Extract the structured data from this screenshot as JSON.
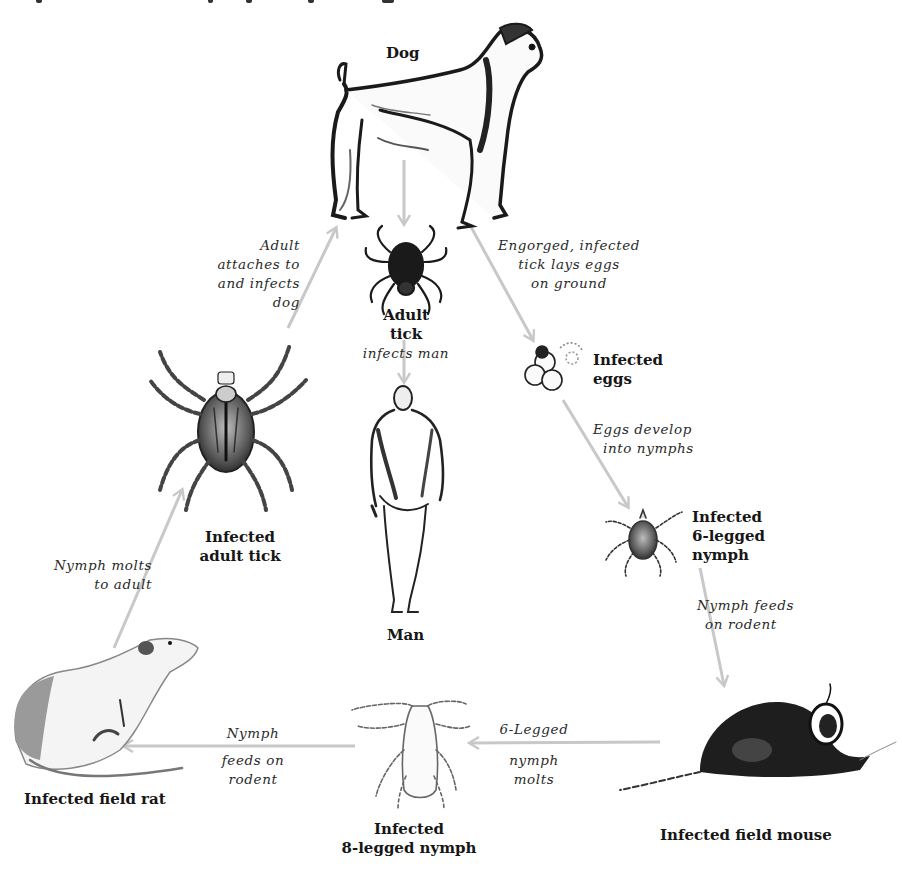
{
  "diagram": {
    "type": "life-cycle",
    "arrow_color": "#c8c8c8",
    "nodes": {
      "dog": {
        "label": "Dog"
      },
      "adult_tick": {
        "label_line1": "Adult",
        "label_line2": "tick",
        "caption": "infects man"
      },
      "man": {
        "label": "Man"
      },
      "infected_eggs": {
        "label_line1": "Infected",
        "label_line2": "eggs"
      },
      "six_legged_nymph": {
        "label_line1": "Infected",
        "label_line2": "6-legged",
        "label_line3": "nymph"
      },
      "field_mouse": {
        "label": "Infected field mouse"
      },
      "eight_legged_nymph": {
        "label_line1": "Infected",
        "label_line2": "8-legged nymph"
      },
      "field_rat": {
        "label": "Infected field rat"
      },
      "infected_adult_tick": {
        "label_line1": "Infected",
        "label_line2": "adult tick"
      }
    },
    "transitions": {
      "adult_to_dog": {
        "line1": "Adult",
        "line2": "attaches to",
        "line3": "and infects",
        "line4": "dog"
      },
      "dog_to_eggs": {
        "line1": "Engorged, infected",
        "line2": "tick lays eggs",
        "line3": "on ground"
      },
      "eggs_to_nymph": {
        "line1": "Eggs develop",
        "line2": "into nymphs"
      },
      "nymph_to_mouse": {
        "line1": "Nymph feeds",
        "line2": "on rodent"
      },
      "mouse_to_8nymph": {
        "line1": "6-Legged",
        "line2": "nymph",
        "line3": "molts"
      },
      "8nymph_to_rat": {
        "line1": "Nymph",
        "line2": "feeds on",
        "line3": "rodent"
      },
      "rat_to_adult": {
        "line1": "Nymph molts",
        "line2": "to adult"
      }
    }
  }
}
